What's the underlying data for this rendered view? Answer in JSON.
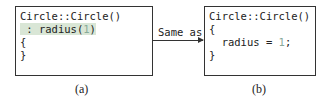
{
  "box_a": {
    "lines": [
      "Circle::Circle()",
      " : radius(",
      "1",
      ")",
      "{",
      "}"
    ],
    "caption": "(a)"
  },
  "box_b": {
    "lines": [
      "Circle::Circle()",
      "{",
      "  radius = ",
      "1",
      ";",
      "}"
    ],
    "caption": "(b)"
  },
  "arrow": {
    "label": "Same as"
  },
  "colors": {
    "highlight": "#d9e6d6",
    "number": "#88aa99",
    "border": "#333333"
  }
}
